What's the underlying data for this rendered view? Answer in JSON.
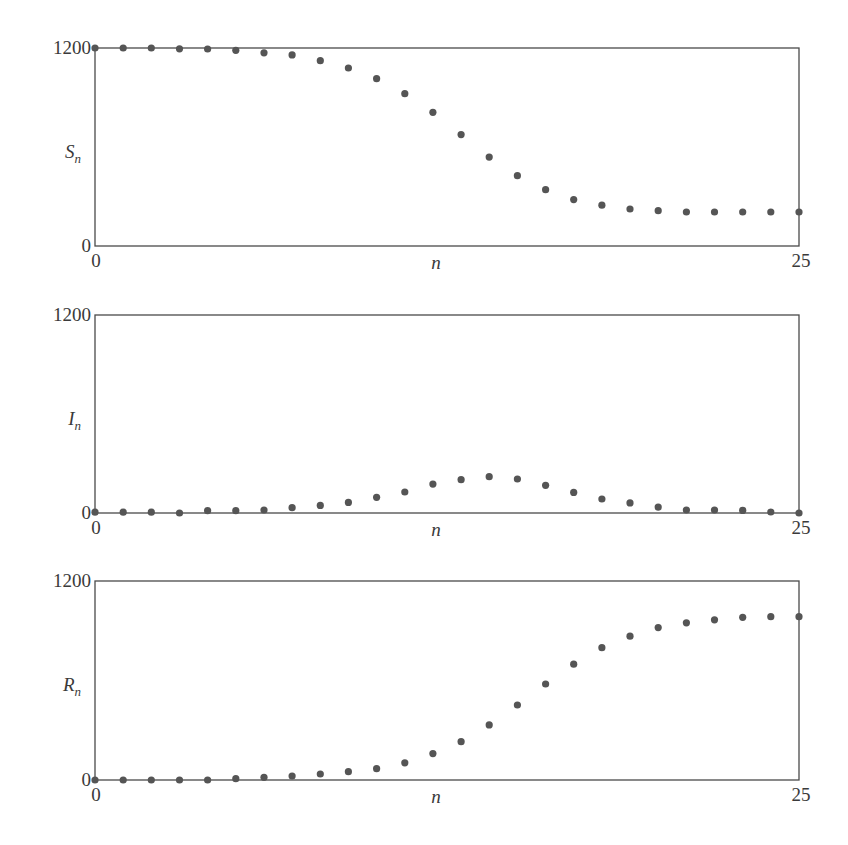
{
  "chart_data": [
    {
      "type": "scatter",
      "title": "",
      "xlabel": "n",
      "ylabel": "S_n",
      "ylabel_main": "S",
      "ylabel_sub": "n",
      "xlim": [
        0,
        25
      ],
      "ylim": [
        0,
        1200
      ],
      "x_ticks": [
        "0",
        "25"
      ],
      "y_ticks": [
        "0",
        "1200"
      ],
      "grid": false,
      "legend": null,
      "x": [
        0,
        1,
        2,
        3,
        4,
        5,
        6,
        7,
        8,
        9,
        10,
        11,
        12,
        13,
        14,
        15,
        16,
        17,
        18,
        19,
        20,
        21,
        22,
        23,
        24,
        25
      ],
      "values": [
        1200,
        1200,
        1200,
        1195,
        1194,
        1186,
        1171,
        1158,
        1123,
        1079,
        1014,
        923,
        810,
        675,
        539,
        426,
        341,
        281,
        247,
        224,
        214,
        206,
        206,
        206,
        206,
        206
      ]
    },
    {
      "type": "scatter",
      "title": "",
      "xlabel": "n",
      "ylabel": "I_n",
      "ylabel_main": "I",
      "ylabel_sub": "n",
      "xlim": [
        0,
        25
      ],
      "ylim": [
        0,
        1200
      ],
      "x_ticks": [
        "0",
        "25"
      ],
      "y_ticks": [
        "0",
        "1200"
      ],
      "grid": false,
      "legend": null,
      "x": [
        0,
        1,
        2,
        3,
        4,
        5,
        6,
        7,
        8,
        9,
        10,
        11,
        12,
        13,
        14,
        15,
        16,
        17,
        18,
        19,
        20,
        21,
        22,
        23,
        24,
        25
      ],
      "values": [
        5,
        5,
        5,
        0,
        14,
        14,
        18,
        32,
        46,
        64,
        95,
        127,
        175,
        202,
        220,
        206,
        168,
        125,
        85,
        61,
        36,
        18,
        18,
        16,
        6,
        0
      ]
    },
    {
      "type": "scatter",
      "title": "",
      "xlabel": "n",
      "ylabel": "R_n",
      "ylabel_main": "R",
      "ylabel_sub": "n",
      "xlim": [
        0,
        25
      ],
      "ylim": [
        0,
        1200
      ],
      "x_ticks": [
        "0",
        "25"
      ],
      "y_ticks": [
        "0",
        "1200"
      ],
      "grid": false,
      "legend": null,
      "x": [
        0,
        1,
        2,
        3,
        4,
        5,
        6,
        7,
        8,
        9,
        10,
        11,
        12,
        13,
        14,
        15,
        16,
        17,
        18,
        19,
        20,
        21,
        22,
        23,
        24,
        25
      ],
      "values": [
        0,
        0,
        0,
        0,
        0,
        8,
        16,
        24,
        36,
        50,
        68,
        104,
        159,
        231,
        332,
        452,
        579,
        698,
        798,
        867,
        919,
        948,
        966,
        981,
        985,
        985
      ]
    }
  ],
  "style": {
    "dot_color": "#555555",
    "axis_color": "#4a4a4a",
    "text_color": "#3a3a3a"
  },
  "layout": {
    "panels": [
      {
        "top": 48,
        "bottom": 246
      },
      {
        "top": 315,
        "bottom": 513
      },
      {
        "top": 581,
        "bottom": 780
      }
    ],
    "left": 95,
    "right": 799
  }
}
